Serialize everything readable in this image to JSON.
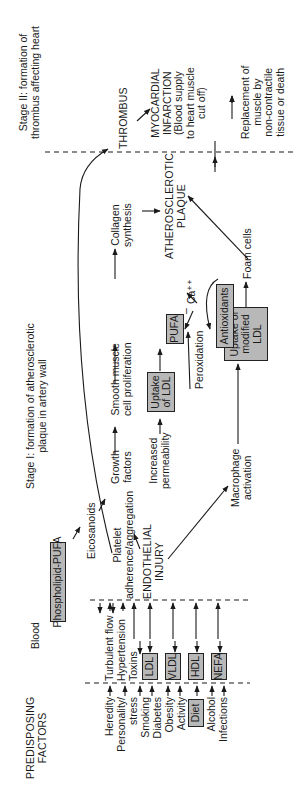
{
  "columns": {
    "predisposing": "PREDISPOSING\nFACTORS",
    "blood": "Blood",
    "stage1": "Stage I: formation of atherosclerotic\nplaque in artery wall",
    "stage2": "Stage II: formation of\nthrombus affecting heart"
  },
  "predisposing_factors": [
    "Heredity",
    "Personality/\nstress",
    "Smoking",
    "Diabetes",
    "Obesity",
    "Activity",
    "Diet",
    "Alcohol",
    "Infections"
  ],
  "blood_factors": {
    "turbulent_flow": "Turbulent flow",
    "hypertension": "Hypertension",
    "toxins": "Toxins",
    "ldl": "LDL",
    "vldl": "VLDL",
    "hdl": "HDL",
    "nefa": "NEFA"
  },
  "nodes": {
    "phospholipid_pufa": "Phospholipid-PUFA",
    "eicosanoids": "Eicosanoids",
    "platelet": "Platelet\nadherence/aggregation",
    "endothelial_injury": "ENDOTHELIAL\nINJURY",
    "growth_factors": "Growth\nfactors",
    "increased_permeability": "Increased\npermeability",
    "macrophage_activation": "Macrophage\nactivation",
    "smooth_muscle": "Smooth muscle\ncell proliferation",
    "uptake_ldl": "Uptake\nof LDL",
    "uptake_modified_ldl": "Uptake of\nmodified\nLDL",
    "pufa": "PUFA",
    "peroxidation": "Peroxidation",
    "antioxidants": "Antioxidants",
    "calcium": "Ca⁺⁺",
    "minus": "–",
    "foam_cells": "Foam cells",
    "collagen_synthesis": "Collagen\nsynthesis",
    "atherosclerotic_plaque": "ATHEROSCLEROTIC\nPLAQUE",
    "thrombus": "THROMBUS",
    "myocardial_infarction": "MYOCARDIAL\nINFARCTION\n(Blood supply\nto heart muscle\ncut off)",
    "replacement": "Replacement of\nmuscle by\nnon-contractile\ntissue or death"
  },
  "colors": {
    "ink": "#1a1a1a",
    "box_fill": "#b8b8b8",
    "background": "#ffffff"
  }
}
